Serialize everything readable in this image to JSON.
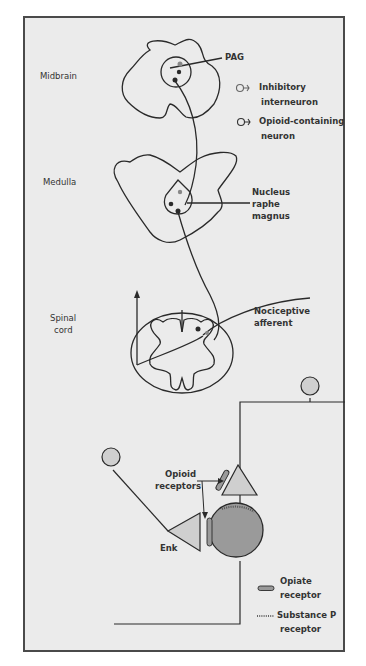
{
  "figure": {
    "regions": {
      "midbrain": "Midbrain",
      "medulla": "Medulla",
      "spinal_cord_line1": "Spinal",
      "spinal_cord_line2": "cord"
    },
    "structures": {
      "pag": "PAG",
      "nrm_line1": "Nucleus",
      "nrm_line2": "raphe",
      "nrm_line3": "magnus",
      "nociceptive_line1": "Nociceptive",
      "nociceptive_line2": "afferent"
    },
    "legend_top": {
      "inhibitory_line1": "Inhibitory",
      "inhibitory_line2": "interneuron",
      "opioid_line1": "Opioid-containing",
      "opioid_line2": "neuron"
    },
    "synapse": {
      "opioid_receptors_line1": "Opioid",
      "opioid_receptors_line2": "receptors",
      "enk": "Enk"
    },
    "legend_bottom": {
      "opiate_line1": "Opiate",
      "opiate_line2": "receptor",
      "substance_p_line1": "Substance P",
      "substance_p_line2": "receptor"
    },
    "colors": {
      "background": "#ebebeb",
      "stroke": "#2a2a2a",
      "light_fill": "#cfcfcf",
      "dark_fill": "#9a9a9a"
    }
  }
}
